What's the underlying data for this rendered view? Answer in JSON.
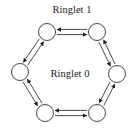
{
  "labels": {
    "outer": "Ringlet 1",
    "inner": "Ringlet 0"
  },
  "colors": {
    "stroke": "#333333",
    "node_fill": "#ffffff",
    "text": "#222222"
  },
  "nodes": [
    {
      "id": "top-left",
      "x": 47,
      "y": 32
    },
    {
      "id": "top-right",
      "x": 97,
      "y": 32
    },
    {
      "id": "right",
      "x": 117,
      "y": 74
    },
    {
      "id": "bottom-right",
      "x": 97,
      "y": 113
    },
    {
      "id": "bottom-left",
      "x": 45,
      "y": 113
    },
    {
      "id": "left",
      "x": 20,
      "y": 72
    }
  ],
  "ringlets": [
    {
      "name": "Ringlet 1",
      "position": "outer",
      "direction": "counter-clockwise"
    },
    {
      "name": "Ringlet 0",
      "position": "inner",
      "direction": "clockwise"
    }
  ]
}
